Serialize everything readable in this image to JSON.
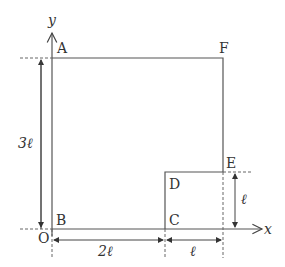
{
  "diagram": {
    "axes": {
      "x_label": "x",
      "y_label": "y",
      "origin_label": "O"
    },
    "points": {
      "A": "A",
      "B": "B",
      "C": "C",
      "D": "D",
      "E": "E",
      "F": "F"
    },
    "dimensions": {
      "height_total": "3ℓ",
      "width_BC": "2ℓ",
      "width_CE": "ℓ",
      "height_CD": "ℓ"
    },
    "colors": {
      "line": "#555555",
      "text": "#333333",
      "background": "#ffffff"
    }
  }
}
